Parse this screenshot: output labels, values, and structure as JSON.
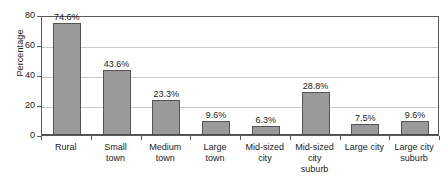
{
  "chart_data": {
    "type": "bar",
    "title": "",
    "subtitle": "",
    "xlabel": "",
    "ylabel": "Percentage",
    "ylim": [
      0,
      80
    ],
    "yticks": [
      0,
      20,
      40,
      60,
      80
    ],
    "ytick_labels": [
      "0",
      "20",
      "40",
      "60",
      "80"
    ],
    "grid": "horizontal",
    "legend": "none",
    "orientation": "vertical",
    "categories": [
      "Rural",
      "Small town",
      "Medium town",
      "Large town",
      "Mid-sized city",
      "Mid-sized city suburb",
      "Large city",
      "Large city suburb"
    ],
    "values": [
      74.6,
      43.6,
      23.3,
      9.6,
      6.3,
      28.8,
      7.5,
      9.6
    ],
    "data_labels": [
      "74.6%",
      "43.6%",
      "23.3%",
      "9.6%",
      "6.3%",
      "28.8%",
      "7.5%",
      "9.6%"
    ],
    "category_label_lines": [
      [
        "Rural"
      ],
      [
        "Small",
        "town"
      ],
      [
        "Medium",
        "town"
      ],
      [
        "Large",
        "town"
      ],
      [
        "Mid-sized",
        "city"
      ],
      [
        "Mid-sized",
        "city",
        "suburb"
      ],
      [
        "Large city"
      ],
      [
        "Large city",
        "suburb"
      ]
    ],
    "colors": {
      "bar_fill": "#9a9a9a",
      "bar_border": "#555555",
      "gridline": "#c9c9c9",
      "axis": "#5a5a5a",
      "text": "#1a1a1a",
      "background": "#ffffff"
    }
  }
}
